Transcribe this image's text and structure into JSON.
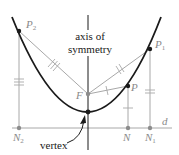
{
  "labels": {
    "P2": "P",
    "P2_sub": "2",
    "P1": "P",
    "P1_sub": "1",
    "P": "P",
    "F": "F",
    "N2": "N",
    "N2_sub": "2",
    "N": "N",
    "N1": "N",
    "N1_sub": "1",
    "d": "d",
    "axis_line1": "axis of",
    "axis_line2": "symmetry",
    "vertex": "vertex"
  },
  "colors": {
    "curve": "#1a1a1a",
    "construction": "#a8a8a8",
    "axis": "#1a1a1a",
    "label_gray": "#8a8a8a",
    "text": "#1a1a1a",
    "point_gray": "#8c8c8c"
  }
}
